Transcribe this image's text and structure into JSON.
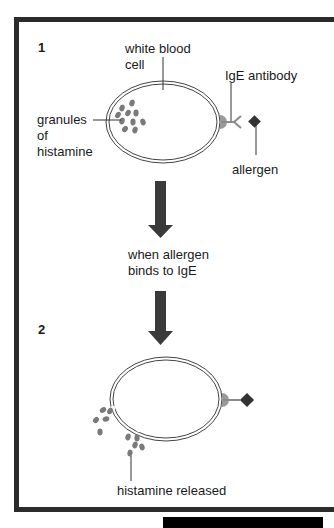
{
  "panel1": {
    "step_number": "1",
    "labels": {
      "white_blood_cell_line1": "white blood",
      "white_blood_cell_line2": "cell",
      "ige_antibody": "IgE antibody",
      "granules_line1": "granules",
      "granules_line2": "of",
      "granules_line3": "histamine",
      "allergen": "allergen"
    }
  },
  "transition": {
    "line1": "when allergen",
    "line2": "binds to IgE"
  },
  "panel2": {
    "step_number": "2",
    "labels": {
      "histamine_released": "histamine released"
    }
  },
  "colors": {
    "frame": "#2b2b2b",
    "arrow": "#3a3a3a",
    "granule": "#7a7a7a",
    "allergen": "#333333",
    "receptor": "#9a9a9a"
  }
}
